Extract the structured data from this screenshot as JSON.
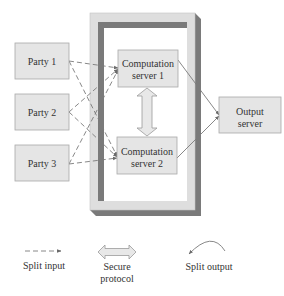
{
  "diagram": {
    "parties": [
      {
        "label": "Party 1"
      },
      {
        "label": "Party 2"
      },
      {
        "label": "Party 3"
      }
    ],
    "computation_servers": [
      {
        "line1": "Computation",
        "line2": "server 1"
      },
      {
        "line1": "Computation",
        "line2": "server 2"
      }
    ],
    "output_server": {
      "line1": "Output",
      "line2": "server"
    },
    "legend": {
      "split_input": {
        "label": "Split input",
        "icon": "dashed-arrow-icon"
      },
      "secure_protocol": {
        "line1": "Secure",
        "line2": "protocol",
        "icon": "double-arrow-icon"
      },
      "split_output": {
        "label": "Split output",
        "icon": "curved-arrow-icon"
      }
    }
  },
  "colors": {
    "box_fill": "#e5e5e5",
    "box_border": "#a9a9a9",
    "frame_light": "#dedede",
    "frame_dark": "#7a7a7a",
    "line": "#7a7a7a",
    "text": "#333333"
  }
}
